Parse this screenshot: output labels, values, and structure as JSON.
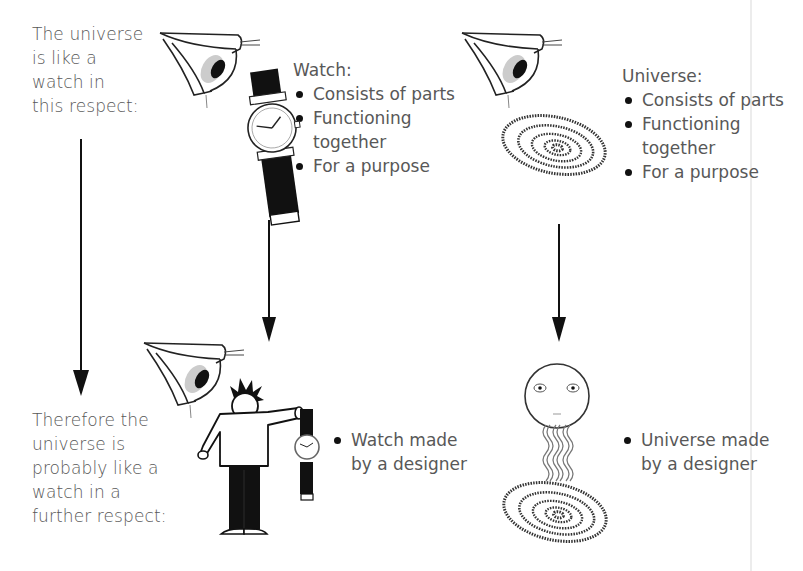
{
  "premise_label": [
    "The universe",
    "is like a",
    "watch in",
    "this respect:"
  ],
  "conclusion_label": [
    "Therefore the",
    "universe is",
    "probably like a",
    "watch in a",
    "further respect:"
  ],
  "watch_panel": {
    "heading": "Watch:",
    "bullets": [
      {
        "text": "Consists of parts"
      },
      {
        "text": "Functioning",
        "cont": "together"
      },
      {
        "text": "For a purpose"
      }
    ]
  },
  "universe_panel": {
    "heading": "Universe:",
    "bullets": [
      {
        "text": "Consists of parts"
      },
      {
        "text": "Functioning",
        "cont": "together"
      },
      {
        "text": "For a purpose"
      }
    ]
  },
  "watch_conclusion": {
    "line1": "Watch made",
    "line2": "by a designer"
  },
  "universe_conclusion": {
    "line1": "Universe made",
    "line2": "by a designer"
  },
  "icons": [
    "eye-icon",
    "wristwatch-icon",
    "spiral-galaxy-icon",
    "person-holding-watch-icon",
    "designer-face-icon",
    "down-arrow-icon"
  ],
  "colors": {
    "text": "#585858",
    "ink": "#111111",
    "iris": "#c8c8c8",
    "background": "#ffffff"
  }
}
